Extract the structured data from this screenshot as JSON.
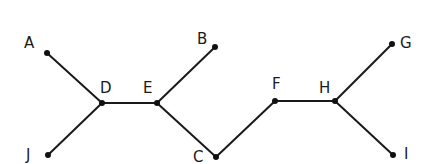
{
  "diagram": {
    "type": "tree",
    "nodes": [
      {
        "id": "A",
        "label": "A",
        "x": 47,
        "y": 53,
        "lx": 24,
        "ly": 48
      },
      {
        "id": "D",
        "label": "D",
        "x": 102,
        "y": 103,
        "lx": 100,
        "ly": 93
      },
      {
        "id": "J",
        "label": "J",
        "x": 48,
        "y": 155,
        "lx": 26,
        "ly": 160
      },
      {
        "id": "E",
        "label": "E",
        "x": 157,
        "y": 103,
        "lx": 143,
        "ly": 93
      },
      {
        "id": "B",
        "label": "B",
        "x": 215,
        "y": 47,
        "lx": 197,
        "ly": 44
      },
      {
        "id": "C",
        "label": "C",
        "x": 216,
        "y": 157,
        "lx": 193,
        "ly": 162
      },
      {
        "id": "F",
        "label": "F",
        "x": 275,
        "y": 101,
        "lx": 272,
        "ly": 89
      },
      {
        "id": "H",
        "label": "H",
        "x": 335,
        "y": 101,
        "lx": 319,
        "ly": 93
      },
      {
        "id": "G",
        "label": "G",
        "x": 392,
        "y": 44,
        "lx": 400,
        "ly": 48
      },
      {
        "id": "I",
        "label": "I",
        "x": 393,
        "y": 155,
        "lx": 404,
        "ly": 159
      }
    ],
    "edges": [
      [
        "A",
        "D"
      ],
      [
        "J",
        "D"
      ],
      [
        "D",
        "E"
      ],
      [
        "E",
        "B"
      ],
      [
        "E",
        "C"
      ],
      [
        "C",
        "F"
      ],
      [
        "F",
        "H"
      ],
      [
        "H",
        "G"
      ],
      [
        "H",
        "I"
      ]
    ]
  }
}
